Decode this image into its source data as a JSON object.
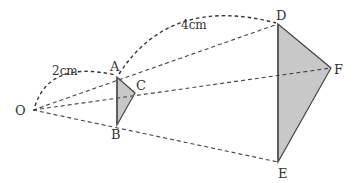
{
  "figure": {
    "points": {
      "O": {
        "label": "O",
        "x": 33,
        "y": 110,
        "label_x": 15,
        "label_y": 115
      },
      "A": {
        "label": "A",
        "x": 117,
        "y": 77,
        "label_x": 110,
        "label_y": 71
      },
      "B": {
        "label": "B",
        "x": 117,
        "y": 125,
        "label_x": 111,
        "label_y": 139
      },
      "C": {
        "label": "C",
        "x": 135,
        "y": 93,
        "label_x": 136,
        "label_y": 90
      },
      "D": {
        "label": "D",
        "x": 278,
        "y": 24,
        "label_x": 277,
        "label_y": 19
      },
      "E": {
        "label": "E",
        "x": 278,
        "y": 162,
        "label_x": 278,
        "label_y": 177
      },
      "F": {
        "label": "F",
        "x": 331,
        "y": 68,
        "label_x": 334,
        "label_y": 73
      }
    },
    "measurements": [
      {
        "id": "OA",
        "text": "2cm",
        "x": 52,
        "y": 75
      },
      {
        "id": "AD",
        "text": "4cm",
        "x": 180,
        "y": 29
      }
    ],
    "triangles": [
      {
        "name": "ABC",
        "vertices": [
          "A",
          "B",
          "C"
        ],
        "fill": "#c8c8c8"
      },
      {
        "name": "DEF",
        "vertices": [
          "D",
          "E",
          "F"
        ],
        "fill": "#c8c8c8"
      }
    ],
    "colors": {
      "stroke": "#444444",
      "fill": "#c8c8c8",
      "text": "#333333"
    }
  }
}
